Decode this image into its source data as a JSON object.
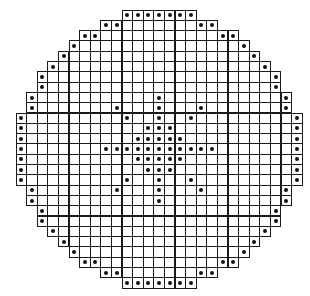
{
  "figure": {
    "grid": {
      "columns": 27,
      "rows": 27,
      "cell_width": 10.6,
      "cell_height": 10.3,
      "line_color": "#1a1a1a",
      "dot_color": "#111111",
      "background": "#ffffff"
    },
    "row_spans": [
      [
        10,
        16
      ],
      [
        8,
        18
      ],
      [
        6,
        20
      ],
      [
        5,
        21
      ],
      [
        4,
        22
      ],
      [
        3,
        23
      ],
      [
        2,
        24
      ],
      [
        2,
        24
      ],
      [
        1,
        25
      ],
      [
        1,
        25
      ],
      [
        0,
        26
      ],
      [
        0,
        26
      ],
      [
        0,
        26
      ],
      [
        0,
        26
      ],
      [
        0,
        26
      ],
      [
        0,
        26
      ],
      [
        0,
        26
      ],
      [
        1,
        25
      ],
      [
        1,
        25
      ],
      [
        2,
        24
      ],
      [
        2,
        24
      ],
      [
        3,
        23
      ],
      [
        4,
        22
      ],
      [
        5,
        21
      ],
      [
        6,
        20
      ],
      [
        8,
        18
      ],
      [
        10,
        16
      ]
    ],
    "boundary_dots": [
      [
        0,
        [
          10,
          11,
          12,
          13,
          14,
          15,
          16
        ]
      ],
      [
        1,
        [
          8,
          9,
          17,
          18
        ]
      ],
      [
        2,
        [
          6,
          7,
          19,
          20
        ]
      ],
      [
        3,
        [
          5,
          21
        ]
      ],
      [
        4,
        [
          4,
          22
        ]
      ],
      [
        5,
        [
          3,
          23
        ]
      ],
      [
        6,
        [
          2,
          24
        ]
      ],
      [
        7,
        [
          2,
          24
        ]
      ],
      [
        8,
        [
          1,
          25
        ]
      ],
      [
        9,
        [
          1,
          25
        ]
      ],
      [
        10,
        [
          0,
          26
        ]
      ],
      [
        11,
        [
          0,
          26
        ]
      ],
      [
        12,
        [
          0,
          26
        ]
      ],
      [
        13,
        [
          0,
          26
        ]
      ],
      [
        14,
        [
          0,
          26
        ]
      ],
      [
        15,
        [
          0,
          26
        ]
      ],
      [
        16,
        [
          0,
          26
        ]
      ],
      [
        17,
        [
          1,
          25
        ]
      ],
      [
        18,
        [
          1,
          25
        ]
      ],
      [
        19,
        [
          2,
          24
        ]
      ],
      [
        20,
        [
          2,
          24
        ]
      ],
      [
        21,
        [
          3,
          23
        ]
      ],
      [
        22,
        [
          4,
          22
        ]
      ],
      [
        23,
        [
          5,
          21
        ]
      ],
      [
        24,
        [
          6,
          7,
          19,
          20
        ]
      ],
      [
        25,
        [
          8,
          9,
          17,
          18
        ]
      ],
      [
        26,
        [
          10,
          11,
          12,
          13,
          14,
          15,
          16
        ]
      ]
    ],
    "star_dots": [
      [
        8,
        [
          13
        ]
      ],
      [
        9,
        [
          9,
          13,
          17
        ]
      ],
      [
        10,
        [
          10,
          13,
          16
        ]
      ],
      [
        11,
        [
          12,
          13,
          14
        ]
      ],
      [
        12,
        [
          11,
          12,
          13,
          14,
          15
        ]
      ],
      [
        13,
        [
          8,
          9,
          10,
          11,
          12,
          13,
          14,
          15,
          16,
          17,
          18
        ]
      ],
      [
        14,
        [
          11,
          12,
          13,
          14,
          15
        ]
      ],
      [
        15,
        [
          12,
          13,
          14
        ]
      ],
      [
        16,
        [
          10,
          13,
          16
        ]
      ],
      [
        17,
        [
          9,
          13,
          17
        ]
      ],
      [
        18,
        [
          13
        ]
      ]
    ]
  }
}
